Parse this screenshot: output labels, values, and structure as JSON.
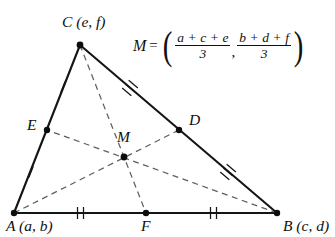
{
  "diagram": {
    "type": "triangle-centroid-medians",
    "vertices": [
      {
        "name": "A",
        "label": "A (a, b)",
        "x": 14,
        "y": 213,
        "label_x": 6,
        "label_y": 218
      },
      {
        "name": "B",
        "label": "B (c, d)",
        "x": 277,
        "y": 213,
        "label_x": 283,
        "label_y": 218
      },
      {
        "name": "C",
        "label": "C (e, f)",
        "x": 80,
        "y": 45,
        "label_x": 62,
        "label_y": 14
      }
    ],
    "midpoints": [
      {
        "name": "D",
        "label": "D",
        "x": 179,
        "y": 130,
        "label_x": 189,
        "label_y": 112,
        "of": "CB"
      },
      {
        "name": "E",
        "label": "E",
        "x": 47,
        "y": 130,
        "label_x": 27,
        "label_y": 117,
        "of": "AC"
      },
      {
        "name": "F",
        "label": "F",
        "x": 146,
        "y": 213,
        "label_x": 141,
        "label_y": 218,
        "of": "AB"
      }
    ],
    "centroid": {
      "name": "M",
      "label": "M",
      "x": 124,
      "y": 157,
      "label_x": 118,
      "label_y": 129
    },
    "medians": [
      {
        "from": "A",
        "to": "D"
      },
      {
        "from": "B",
        "to": "E"
      },
      {
        "from": "C",
        "to": "F"
      }
    ],
    "sides": [
      {
        "from": "A",
        "to": "B",
        "ticks": 2
      },
      {
        "from": "B",
        "to": "C",
        "ticks": 3
      },
      {
        "from": "C",
        "to": "A",
        "ticks": 1
      }
    ],
    "tick_groups": [
      {
        "segment": "AF",
        "count": 2,
        "x": 80,
        "y": 213,
        "angle": 0
      },
      {
        "segment": "FB",
        "count": 2,
        "x": 213,
        "y": 213,
        "angle": 0
      },
      {
        "segment": "CE",
        "count": 1,
        "x": 63,
        "y": 87,
        "angle": 68
      },
      {
        "segment": "EA",
        "count": 1,
        "x": 31,
        "y": 172,
        "angle": 68
      },
      {
        "segment": "CD",
        "count": 3,
        "x": 130,
        "y": 88,
        "angle": -40
      },
      {
        "segment": "DB",
        "count": 3,
        "x": 228,
        "y": 172,
        "angle": -40
      }
    ],
    "colors": {
      "solid_line": "#151515",
      "dashed_line": "#5a5a5a",
      "point": "#0d0d0d",
      "text": "#101010",
      "background": "#ffffff"
    }
  },
  "formula": {
    "lhs": "M",
    "equals": "=",
    "open_paren": "(",
    "close_paren": ")",
    "comma": ",",
    "x_component": {
      "numerator": "a + c + e",
      "denominator": "3",
      "terms": [
        "a",
        "c",
        "e"
      ],
      "plus": "+"
    },
    "y_component": {
      "numerator": "b + d + f",
      "denominator": "3",
      "terms": [
        "b",
        "d",
        "f"
      ],
      "plus": "+"
    },
    "full_text": "M = ( (a+c+e)/3 , (b+d+f)/3 )"
  }
}
